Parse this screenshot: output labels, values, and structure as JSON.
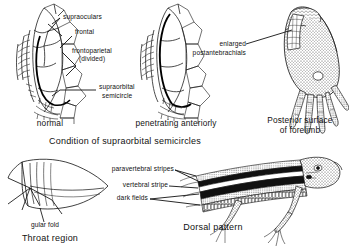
{
  "plate": {
    "title_note": "Lizard identification characters plate",
    "panels": [
      {
        "id": "supraorbital-normal",
        "caption": "normal",
        "labels": [
          {
            "name": "supraoculars",
            "text": "supraoculars"
          },
          {
            "name": "frontal",
            "text": "frontal"
          },
          {
            "name": "frontoparietal",
            "text": "frontoparietal"
          },
          {
            "name": "frontoparietal-divided",
            "text": "(divided)"
          },
          {
            "name": "supraorbital",
            "text": "supraorbital"
          },
          {
            "name": "semicircle",
            "text": "semicircle"
          }
        ]
      },
      {
        "id": "supraorbital-penetrating",
        "caption": "penetrating anteriorly",
        "labels": []
      },
      {
        "id": "forelimb",
        "caption_line1": "Posterior surface",
        "caption_line2": "of forelimb",
        "labels": [
          {
            "name": "enlarged",
            "text": "enlarged"
          },
          {
            "name": "postantebrachials",
            "text": "postantebrachials"
          }
        ]
      },
      {
        "id": "throat",
        "label": "gular fold",
        "caption": "Throat region"
      },
      {
        "id": "dorsal",
        "caption": "Dorsal pattern",
        "labels": [
          {
            "name": "paravertebral-stripes",
            "text": "paravertebral stripes"
          },
          {
            "name": "vertebral-stripe",
            "text": "vertebral stripe"
          },
          {
            "name": "dark-fields",
            "text": "dark fields"
          }
        ]
      }
    ],
    "group_caption": "Condition of supraorbital semicircles"
  },
  "colors": {
    "ink": "#111111",
    "paper": "#ffffff",
    "stipple": "#4a4a4a"
  }
}
